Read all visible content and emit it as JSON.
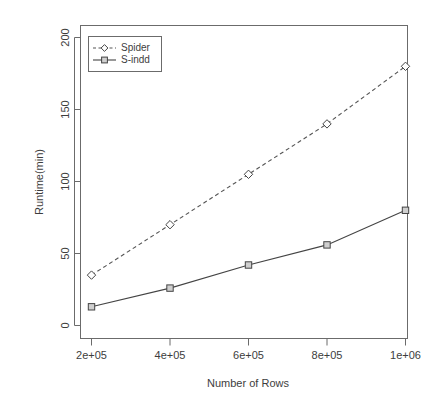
{
  "chart_data": {
    "type": "line",
    "title": "",
    "xlabel": "Number of Rows",
    "ylabel": "Runtime(min)",
    "x": [
      200000,
      400000,
      600000,
      800000,
      1000000
    ],
    "xtick_labels": [
      "2e+05",
      "4e+05",
      "6e+05",
      "8e+05",
      "1e+06"
    ],
    "ytick_labels": [
      "0",
      "50",
      "100",
      "150",
      "200"
    ],
    "yticks": [
      0,
      50,
      100,
      150,
      200
    ],
    "xlim": [
      200000,
      1000000
    ],
    "ylim": [
      0,
      200
    ],
    "grid": false,
    "legend_position": "top-left",
    "series": [
      {
        "name": "Spider",
        "values": [
          35,
          70,
          105,
          140,
          180
        ],
        "linestyle": "dashed",
        "marker": "diamond",
        "color": "#555555"
      },
      {
        "name": "S-indd",
        "values": [
          13,
          26,
          42,
          56,
          80
        ],
        "linestyle": "solid",
        "marker": "square",
        "color": "#444444"
      }
    ]
  },
  "legend": {
    "entries": [
      {
        "label": "Spider"
      },
      {
        "label": "S-indd"
      }
    ]
  },
  "axes": {
    "x_title": "Number of Rows",
    "y_title": "Runtime(min)",
    "x_ticks": [
      "2e+05",
      "4e+05",
      "6e+05",
      "8e+05",
      "1e+06"
    ],
    "y_ticks": [
      "0",
      "50",
      "100",
      "150",
      "200"
    ]
  },
  "colors": {
    "axis": "#6b6b6b",
    "text": "#3d3d3d",
    "spider": "#555555",
    "sindd": "#444444",
    "background": "#ffffff"
  }
}
